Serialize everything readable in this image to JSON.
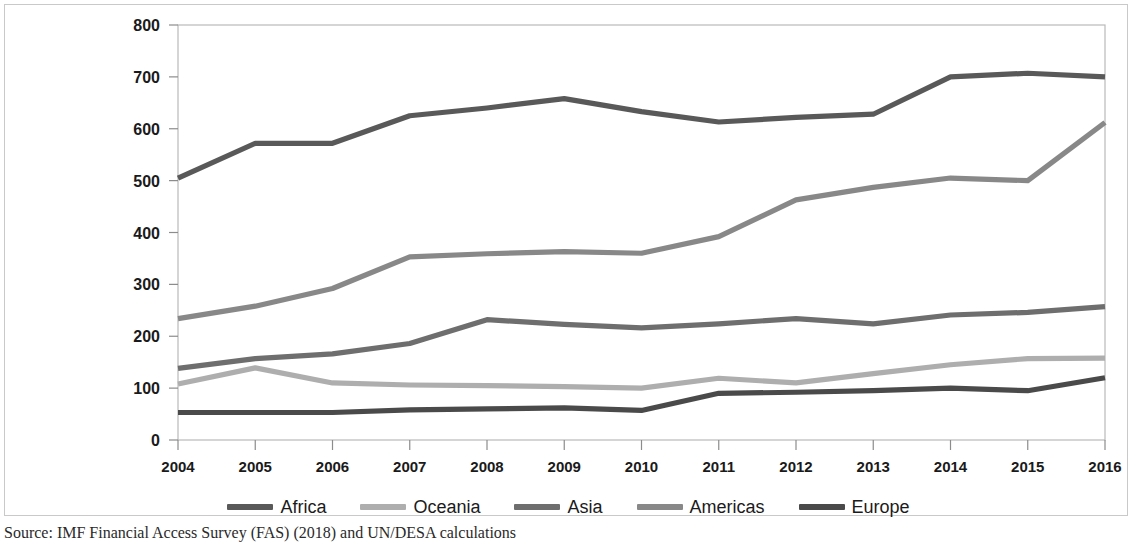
{
  "source_note": "Source:  IMF Financial Access Survey (FAS) (2018) and UN/DESA calculations",
  "legend": {
    "items": [
      {
        "label": "Africa",
        "color": "#595959"
      },
      {
        "label": "Oceania",
        "color": "#aeaeae"
      },
      {
        "label": "Asia",
        "color": "#6e6e6e"
      },
      {
        "label": "Americas",
        "color": "#888888"
      },
      {
        "label": "Europe",
        "color": "#4a4a4a"
      }
    ]
  },
  "bleed_text": [
    {
      "x": 1150,
      "y": 30,
      "text": ""
    }
  ],
  "chart_data": {
    "type": "line",
    "title": "",
    "subtitle": "",
    "xlabel": "",
    "ylabel": "",
    "x": [
      2004,
      2005,
      2006,
      2007,
      2008,
      2009,
      2010,
      2011,
      2012,
      2013,
      2014,
      2015,
      2016
    ],
    "categories": [
      "2004",
      "2005",
      "2006",
      "2007",
      "2008",
      "2009",
      "2010",
      "2011",
      "2012",
      "2013",
      "2014",
      "2015",
      "2016"
    ],
    "ylim": [
      0,
      800
    ],
    "ytick_step": 100,
    "yticks": [
      0,
      100,
      200,
      300,
      400,
      500,
      600,
      700,
      800
    ],
    "grid": false,
    "legend_position": "bottom",
    "series": [
      {
        "name": "Africa",
        "color": "#595959",
        "values": [
          505,
          572,
          572,
          625,
          640,
          658,
          633,
          613,
          622,
          628,
          700,
          707,
          700
        ]
      },
      {
        "name": "Oceania",
        "color": "#aeaeae",
        "values": [
          108,
          139,
          110,
          106,
          105,
          103,
          100,
          119,
          110,
          128,
          145,
          157,
          158
        ]
      },
      {
        "name": "Asia",
        "color": "#6e6e6e",
        "values": [
          138,
          157,
          166,
          186,
          232,
          223,
          216,
          224,
          234,
          224,
          241,
          246,
          257
        ]
      },
      {
        "name": "Americas",
        "color": "#888888",
        "values": [
          234,
          258,
          292,
          353,
          359,
          363,
          360,
          392,
          463,
          487,
          505,
          500,
          612
        ]
      },
      {
        "name": "Europe",
        "color": "#4a4a4a",
        "values": [
          53,
          53,
          53,
          58,
          60,
          62,
          57,
          90,
          92,
          95,
          100,
          95,
          120
        ]
      }
    ]
  }
}
